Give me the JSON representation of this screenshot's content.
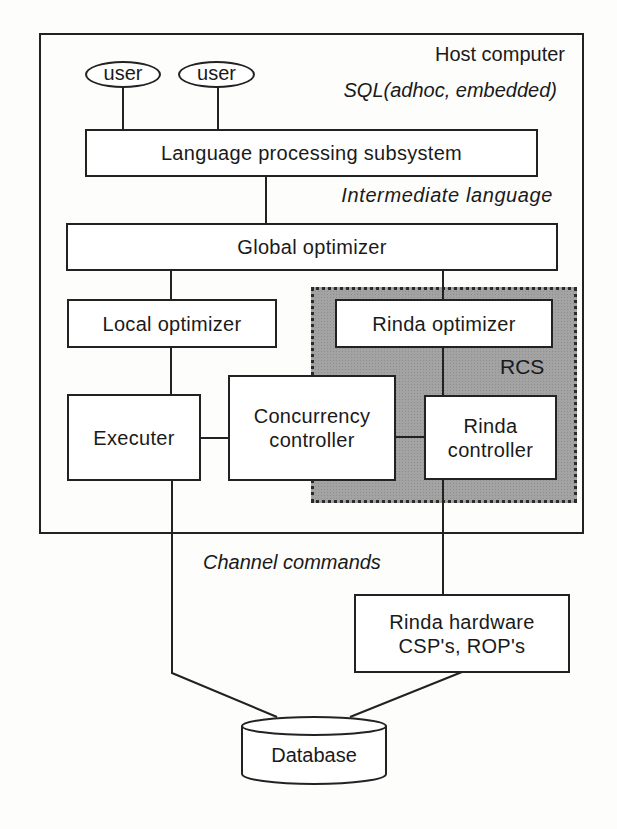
{
  "diagram": {
    "host": {
      "label": "Host computer"
    },
    "users": [
      {
        "label": "user"
      },
      {
        "label": "user"
      }
    ],
    "annotations": {
      "sql": "SQL(adhoc, embedded)",
      "intermediate": "Intermediate language",
      "channel": "Channel commands",
      "rcs": "RCS"
    },
    "nodes": {
      "language_processing": "Language processing subsystem",
      "global_optimizer": "Global optimizer",
      "local_optimizer": "Local optimizer",
      "rinda_optimizer": "Rinda optimizer",
      "executer": "Executer",
      "concurrency_line1": "Concurrency",
      "concurrency_line2": "controller",
      "rinda_controller_line1": "Rinda",
      "rinda_controller_line2": "controller",
      "rinda_hardware_line1": "Rinda hardware",
      "rinda_hardware_line2": "CSP's, ROP's",
      "database": "Database"
    },
    "colors": {
      "line": "#222222",
      "rcs_fill": "#a3a3a3",
      "background": "#fdfdfc"
    }
  }
}
